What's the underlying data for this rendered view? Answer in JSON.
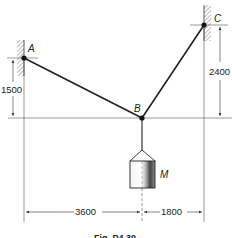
{
  "figure": {
    "caption": "Fig. P4.39",
    "colors": {
      "ink": "#222222",
      "thin": "#555555",
      "hatch": "#666666",
      "mass_dark": "#444444",
      "mass_light": "#e8e8e8"
    },
    "points": {
      "A": {
        "label": "A"
      },
      "B": {
        "label": "B"
      },
      "C": {
        "label": "C"
      }
    },
    "mass": {
      "label": "M"
    },
    "dimensions": {
      "vertical_A": "1500",
      "vertical_C": "2400",
      "horizontal_left": "3600",
      "horizontal_right": "1800"
    }
  }
}
